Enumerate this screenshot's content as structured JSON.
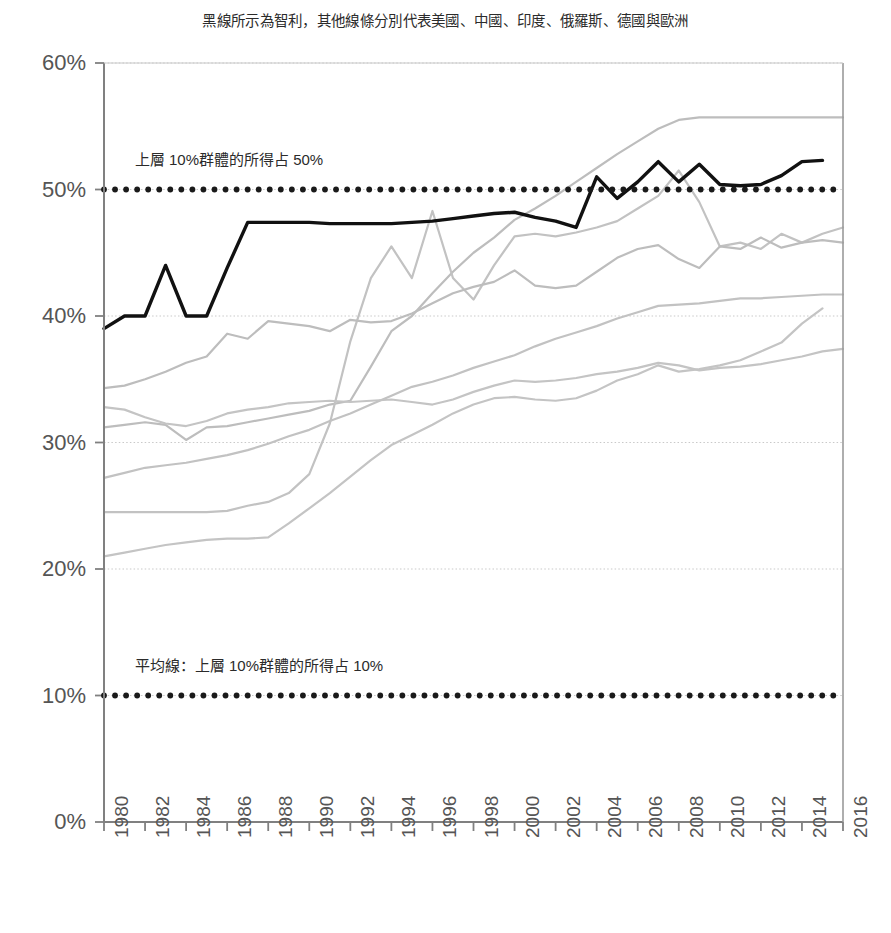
{
  "chart_data": {
    "type": "line",
    "title": "黑線所示為智利，其他線條分別代表美國、中國、印度、俄羅斯、德國與歐洲",
    "xlabel": "",
    "ylabel": "",
    "xlim": [
      1980,
      2016
    ],
    "ylim": [
      0,
      60
    ],
    "grid": true,
    "legend_position": "none",
    "x_tick_labels": [
      "1980",
      "1982",
      "1984",
      "1986",
      "1988",
      "1990",
      "1992",
      "1994",
      "1996",
      "1998",
      "2000",
      "2002",
      "2004",
      "2006",
      "2008",
      "2010",
      "2012",
      "2014",
      "2016"
    ],
    "y_tick_labels": [
      "0%",
      "10%",
      "20%",
      "30%",
      "40%",
      "50%",
      "60%"
    ],
    "y_tick_values": [
      0,
      10,
      20,
      30,
      40,
      50,
      60
    ],
    "x": [
      1980,
      1981,
      1982,
      1983,
      1984,
      1985,
      1986,
      1987,
      1988,
      1989,
      1990,
      1991,
      1992,
      1993,
      1994,
      1995,
      1996,
      1997,
      1998,
      1999,
      2000,
      2001,
      2002,
      2003,
      2004,
      2005,
      2006,
      2007,
      2008,
      2009,
      2010,
      2011,
      2012,
      2013,
      2014,
      2015,
      2016
    ],
    "annotations": [
      {
        "text": "上層 10%群體的所得占 50%",
        "x": 1981.5,
        "y": 52.6
      },
      {
        "text": "平均線：上層 10%群體的所得占 10%",
        "x": 1981.5,
        "y": 12.6
      }
    ],
    "reference_lines": [
      {
        "name": "50% reference",
        "value": 50,
        "style": "dotted",
        "color": "#1a1a1a"
      },
      {
        "name": "10% average line",
        "value": 10,
        "style": "dotted",
        "color": "#1a1a1a"
      }
    ],
    "series": [
      {
        "name": "智利 (Chile)",
        "color": "#111111",
        "highlight": true,
        "values": [
          39.0,
          40.0,
          40.0,
          44.0,
          40.0,
          40.0,
          43.8,
          47.4,
          47.4,
          47.4,
          47.4,
          47.3,
          47.3,
          47.3,
          47.3,
          47.4,
          47.5,
          47.7,
          47.9,
          48.1,
          48.2,
          47.8,
          47.5,
          47.0,
          51.0,
          49.3,
          50.6,
          52.2,
          50.6,
          52.0,
          50.4,
          50.3,
          50.4,
          51.1,
          52.2,
          52.3,
          null
        ]
      },
      {
        "name": "印度 (India)",
        "color": "#bdbdbd",
        "highlight": false,
        "values": [
          31.2,
          31.4,
          31.6,
          31.4,
          30.2,
          31.2,
          31.3,
          31.6,
          31.9,
          32.2,
          32.5,
          33.0,
          33.3,
          36.0,
          38.8,
          40.0,
          41.8,
          43.5,
          45.0,
          46.2,
          47.6,
          48.5,
          49.5,
          50.6,
          51.7,
          52.8,
          53.8,
          54.8,
          55.5,
          55.7,
          55.7,
          55.7,
          55.7,
          55.7,
          55.7,
          55.7,
          55.7
        ]
      },
      {
        "name": "俄羅斯 (Russia)",
        "color": "#c2c2c2",
        "highlight": false,
        "values": [
          24.5,
          24.5,
          24.5,
          24.5,
          24.5,
          24.5,
          24.6,
          25.0,
          25.3,
          26.0,
          27.5,
          31.5,
          38.0,
          43.0,
          45.5,
          43.0,
          48.3,
          43.0,
          41.3,
          44.0,
          46.3,
          46.5,
          46.3,
          46.6,
          47.0,
          47.5,
          48.5,
          49.5,
          51.5,
          49.0,
          45.5,
          45.8,
          45.3,
          46.5,
          45.8,
          46.5,
          47.0
        ]
      },
      {
        "name": "美國 (United States)",
        "color": "#bdbdbd",
        "highlight": false,
        "values": [
          34.3,
          34.5,
          35.0,
          35.6,
          36.3,
          36.8,
          38.6,
          38.2,
          39.6,
          39.4,
          39.2,
          38.8,
          39.7,
          39.5,
          39.6,
          40.2,
          41.0,
          41.8,
          42.3,
          42.7,
          43.6,
          42.4,
          42.2,
          42.4,
          43.5,
          44.6,
          45.3,
          45.6,
          44.5,
          43.8,
          45.5,
          45.3,
          46.2,
          45.4,
          45.8,
          46.0,
          45.8
        ]
      },
      {
        "name": "中國 (China)",
        "color": "#c2c2c2",
        "highlight": false,
        "values": [
          27.2,
          27.6,
          28.0,
          28.2,
          28.4,
          28.7,
          29.0,
          29.4,
          29.9,
          30.5,
          31.0,
          31.7,
          32.3,
          33.0,
          33.7,
          34.4,
          34.8,
          35.3,
          35.9,
          36.4,
          36.9,
          37.6,
          38.2,
          38.7,
          39.2,
          39.8,
          40.3,
          40.8,
          40.9,
          41.0,
          41.2,
          41.4,
          41.4,
          41.5,
          41.6,
          41.7,
          41.7
        ]
      },
      {
        "name": "歐洲 (Europe)",
        "color": "#c4c4c4",
        "highlight": false,
        "values": [
          32.8,
          32.6,
          32.0,
          31.5,
          31.3,
          31.7,
          32.3,
          32.6,
          32.8,
          33.1,
          33.2,
          33.3,
          33.2,
          33.3,
          33.4,
          33.2,
          33.0,
          33.4,
          34.0,
          34.5,
          34.9,
          34.8,
          34.9,
          35.1,
          35.4,
          35.6,
          35.9,
          36.3,
          36.1,
          35.7,
          35.9,
          36.0,
          36.2,
          36.5,
          36.8,
          37.2,
          37.4
        ]
      },
      {
        "name": "德國 (Germany)",
        "color": "#c4c4c4",
        "highlight": false,
        "values": [
          21.0,
          21.3,
          21.6,
          21.9,
          22.1,
          22.3,
          22.4,
          22.4,
          22.5,
          23.6,
          24.8,
          26.0,
          27.3,
          28.6,
          29.8,
          30.6,
          31.4,
          32.3,
          33.0,
          33.5,
          33.6,
          33.4,
          33.3,
          33.5,
          34.1,
          34.9,
          35.4,
          36.1,
          35.6,
          35.8,
          36.1,
          36.5,
          37.2,
          37.9,
          39.4,
          40.6,
          null
        ]
      }
    ]
  }
}
